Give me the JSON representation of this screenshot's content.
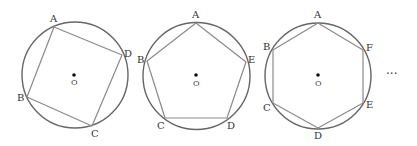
{
  "figures": [
    {
      "name": "square",
      "center_label": "O",
      "vertex_labels": [
        "A",
        "D",
        "C",
        "B"
      ]
    },
    {
      "name": "pentagon",
      "center_label": "O",
      "vertex_labels": [
        "A",
        "E",
        "D",
        "C",
        "B"
      ]
    },
    {
      "name": "hexagon",
      "center_label": "O",
      "vertex_labels": [
        "A",
        "F",
        "E",
        "D",
        "C",
        "B"
      ]
    }
  ],
  "continuation": "···",
  "colors": {
    "circle": "#666666",
    "polygon": "#8a8a8a",
    "center_dot": "#111111"
  }
}
